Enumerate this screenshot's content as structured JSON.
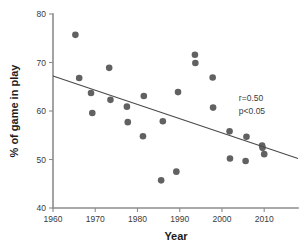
{
  "chart_data": {
    "type": "scatter",
    "title": "",
    "xlabel": "Year",
    "ylabel": "% of game in play",
    "xlim": [
      1960,
      2018
    ],
    "ylim": [
      40,
      80
    ],
    "xticks": [
      1960,
      1970,
      1980,
      1990,
      2000,
      2010
    ],
    "yticks": [
      40,
      50,
      60,
      70,
      80
    ],
    "xtick_labels": [
      "1960",
      "1970",
      "1980",
      "1990",
      "2000",
      "2010"
    ],
    "ytick_labels": [
      "40",
      "50",
      "60",
      "70",
      "80"
    ],
    "grid": false,
    "legend": null,
    "marker_color": "#616161",
    "trendline_color": "#4a4a4a",
    "axis_color": "#8c8c8c",
    "points": [
      {
        "x": 1965.3,
        "y": 75.7
      },
      {
        "x": 1966.2,
        "y": 66.8
      },
      {
        "x": 1969.0,
        "y": 63.7
      },
      {
        "x": 1969.3,
        "y": 59.6
      },
      {
        "x": 1973.3,
        "y": 68.9
      },
      {
        "x": 1973.6,
        "y": 62.3
      },
      {
        "x": 1977.5,
        "y": 60.9
      },
      {
        "x": 1977.7,
        "y": 57.7
      },
      {
        "x": 1981.5,
        "y": 63.1
      },
      {
        "x": 1981.3,
        "y": 54.8
      },
      {
        "x": 1985.6,
        "y": 45.7
      },
      {
        "x": 1986.0,
        "y": 57.9
      },
      {
        "x": 1989.2,
        "y": 47.5
      },
      {
        "x": 1989.6,
        "y": 63.9
      },
      {
        "x": 1993.6,
        "y": 71.6
      },
      {
        "x": 1993.7,
        "y": 69.9
      },
      {
        "x": 1997.8,
        "y": 66.9
      },
      {
        "x": 1997.9,
        "y": 60.7
      },
      {
        "x": 2001.8,
        "y": 55.8
      },
      {
        "x": 2001.9,
        "y": 50.2
      },
      {
        "x": 2005.6,
        "y": 49.7
      },
      {
        "x": 2005.8,
        "y": 54.7
      },
      {
        "x": 2009.5,
        "y": 52.9
      },
      {
        "x": 2009.6,
        "y": 52.4
      },
      {
        "x": 2010.0,
        "y": 51.1
      }
    ],
    "trendline": {
      "x0": 1960,
      "y0": 67.2,
      "x1": 2018,
      "y1": 50.2
    },
    "annotations": [
      {
        "text": "r=0.50",
        "x": 2004,
        "y": 62.0
      },
      {
        "text": "p<0.05",
        "x": 2004,
        "y": 59.3
      }
    ]
  }
}
